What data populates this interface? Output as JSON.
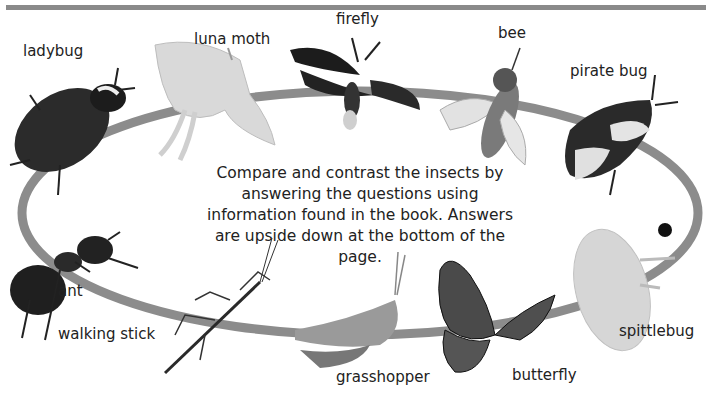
{
  "page": {
    "instructions": "Compare and contrast the insects by answering the questions using information found in the book. Answers are upside down at the bottom of the page.",
    "colors": {
      "ring": "#8c8c8c",
      "topbar": "#8a8a8a"
    }
  },
  "insects": [
    {
      "id": "ladybug",
      "label": "ladybug"
    },
    {
      "id": "luna-moth",
      "label": "luna moth"
    },
    {
      "id": "firefly",
      "label": "firefly"
    },
    {
      "id": "bee",
      "label": "bee"
    },
    {
      "id": "pirate-bug",
      "label": "pirate bug"
    },
    {
      "id": "spittlebug",
      "label": "spittlebug"
    },
    {
      "id": "butterfly",
      "label": "butterfly"
    },
    {
      "id": "grasshopper",
      "label": "grasshopper"
    },
    {
      "id": "walking-stick",
      "label": "walking stick"
    },
    {
      "id": "ant",
      "label": "ant"
    }
  ]
}
